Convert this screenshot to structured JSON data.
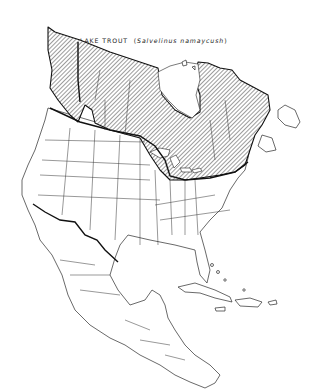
{
  "map": {
    "title": "LAKE TROUT",
    "scientific_name_open": "(",
    "scientific_name": "Salvelinus namaycush",
    "scientific_name_close": ")",
    "region": "North America",
    "legend": {
      "hatched": "native range of lake trout"
    },
    "colors": {
      "outline": "#111111",
      "background": "#ffffff",
      "hatch": "#222222"
    }
  }
}
